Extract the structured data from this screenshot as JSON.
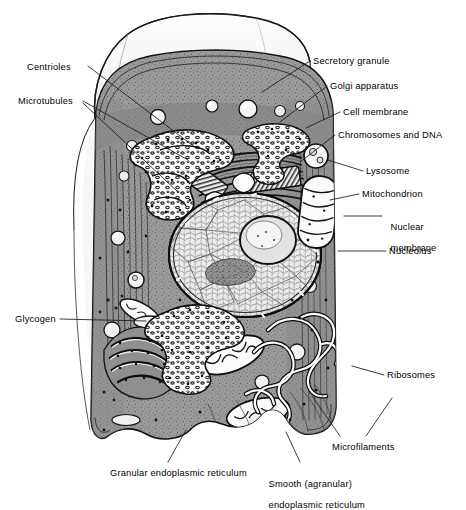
{
  "figure": {
    "style": "black and white stippled line drawing",
    "background_color": "#ffffff",
    "ink_color": "#000000",
    "cytoplasm_color": "#8f8f8f",
    "membrane_flap_color": "#f2f2f2",
    "nucleus_color": "#e8e8e8"
  },
  "labels": [
    {
      "id": "centrioles",
      "text": "Centrioles",
      "side": "left",
      "x": 27,
      "y": 62,
      "lines": [
        "Centrioles"
      ]
    },
    {
      "id": "microtubules",
      "text": "Microtubules",
      "side": "left",
      "x": 18,
      "y": 96,
      "lines": [
        "Microtubules"
      ]
    },
    {
      "id": "glycogen",
      "text": "Glycogen",
      "side": "left",
      "x": 15,
      "y": 315,
      "lines": [
        "Glycogen"
      ]
    },
    {
      "id": "secretory-granule",
      "text": "Secretory granule",
      "side": "right",
      "x": 313,
      "y": 57,
      "lines": [
        "Secretory granule"
      ]
    },
    {
      "id": "golgi-apparatus",
      "text": "Golgi apparatus",
      "side": "right",
      "x": 330,
      "y": 82,
      "lines": [
        "Golgi apparatus"
      ]
    },
    {
      "id": "cell-membrane",
      "text": "Cell membrane",
      "side": "right",
      "x": 343,
      "y": 108,
      "lines": [
        "Cell membrane"
      ]
    },
    {
      "id": "chromosomes-and-dna",
      "text": "Chromosomes and DNA",
      "side": "right",
      "x": 338,
      "y": 131,
      "lines": [
        "Chromosomes and DNA"
      ]
    },
    {
      "id": "lysosome",
      "text": "Lysosome",
      "side": "right",
      "x": 366,
      "y": 167,
      "lines": [
        "Lysosome"
      ]
    },
    {
      "id": "mitochondrion",
      "text": "Mitochondrion",
      "side": "right",
      "x": 362,
      "y": 190,
      "lines": [
        "Mitochondrion"
      ]
    },
    {
      "id": "nuclear-membrane",
      "text": "Nuclear membrane",
      "side": "right",
      "x": 385,
      "y": 217,
      "lines": [
        "Nuclear",
        "membrane"
      ]
    },
    {
      "id": "nucleolus",
      "text": "Nucleolus",
      "side": "right",
      "x": 389,
      "y": 247,
      "lines": [
        "Nucleolus"
      ]
    },
    {
      "id": "ribosomes",
      "text": "Ribosomes",
      "side": "right",
      "x": 387,
      "y": 371,
      "lines": [
        "Ribosomes"
      ]
    },
    {
      "id": "microfilaments",
      "text": "Microfilaments",
      "side": "right",
      "x": 332,
      "y": 443,
      "lines": [
        "Microfilaments"
      ]
    },
    {
      "id": "granular-er",
      "text": "Granular endoplasmic reticulum",
      "side": "bottom",
      "x": 110,
      "y": 470,
      "lines": [
        "Granular endoplasmic reticulum"
      ]
    },
    {
      "id": "smooth-er",
      "text": "Smooth (agranular) endoplasmic reticulum",
      "side": "bottom",
      "x": 263,
      "y": 470,
      "lines": [
        "Smooth (agranular)",
        "endoplasmic reticulum"
      ]
    }
  ],
  "leader_lines": [
    {
      "id": "centrioles-leader",
      "from": [
        88,
        66
      ],
      "to": [
        196,
        148
      ]
    },
    {
      "id": "microtubules-leader-a",
      "from": [
        83,
        101
      ],
      "to": [
        188,
        160
      ]
    },
    {
      "id": "microtubules-leader-b",
      "from": [
        83,
        103
      ],
      "to": [
        178,
        185
      ]
    },
    {
      "id": "secretory-granule-leader",
      "from": [
        310,
        61
      ],
      "to": [
        268,
        92
      ]
    },
    {
      "id": "golgi-leader",
      "from": [
        327,
        86
      ],
      "to": [
        276,
        118
      ]
    },
    {
      "id": "cell-membrane-leader",
      "from": [
        340,
        112
      ],
      "to": [
        303,
        126
      ]
    },
    {
      "id": "chromosomes-leader",
      "from": [
        335,
        135
      ],
      "to": [
        300,
        160
      ]
    },
    {
      "id": "lysosome-leader",
      "from": [
        363,
        171
      ],
      "to": [
        325,
        176
      ]
    },
    {
      "id": "mitochondrion-leader",
      "from": [
        359,
        194
      ],
      "to": [
        318,
        200
      ]
    },
    {
      "id": "nuclear-membrane-leader",
      "from": [
        382,
        216
      ],
      "to": [
        345,
        216
      ]
    },
    {
      "id": "nucleolus-leader",
      "from": [
        386,
        251
      ],
      "to": [
        338,
        251
      ]
    },
    {
      "id": "ribosomes-leader",
      "from": [
        384,
        375
      ],
      "to": [
        352,
        367
      ]
    },
    {
      "id": "microfilaments-leader-a",
      "from": [
        340,
        436
      ],
      "to": [
        314,
        397
      ]
    },
    {
      "id": "microfilaments-leader-b",
      "from": [
        364,
        436
      ],
      "to": [
        390,
        396
      ]
    },
    {
      "id": "granular-er-leader",
      "from": [
        168,
        463
      ],
      "to": [
        185,
        430
      ]
    },
    {
      "id": "smooth-er-leader",
      "from": [
        300,
        463
      ],
      "to": [
        288,
        432
      ]
    }
  ],
  "organelles": [
    {
      "id": "cell-membrane-outline",
      "name": "cell membrane"
    },
    {
      "id": "membrane-flap",
      "name": "cutaway membrane flap"
    },
    {
      "id": "nucleus",
      "name": "nucleus with chromatin"
    },
    {
      "id": "nucleolus",
      "name": "nucleolus"
    },
    {
      "id": "golgi-apparatus",
      "name": "golgi apparatus stacks"
    },
    {
      "id": "centriole-pair",
      "name": "centriole pair"
    },
    {
      "id": "mitochondria",
      "name": "mitochondria"
    },
    {
      "id": "lysosomes",
      "name": "lysosomes"
    },
    {
      "id": "rough-er",
      "name": "granular (rough) endoplasmic reticulum"
    },
    {
      "id": "smooth-er",
      "name": "smooth (agranular) endoplasmic reticulum"
    },
    {
      "id": "glycogen-granules",
      "name": "glycogen granules"
    },
    {
      "id": "secretory-granules",
      "name": "secretory granules"
    },
    {
      "id": "ribosomes",
      "name": "ribosomes"
    },
    {
      "id": "microfilaments",
      "name": "microfilaments"
    },
    {
      "id": "microtubules",
      "name": "microtubules"
    }
  ]
}
